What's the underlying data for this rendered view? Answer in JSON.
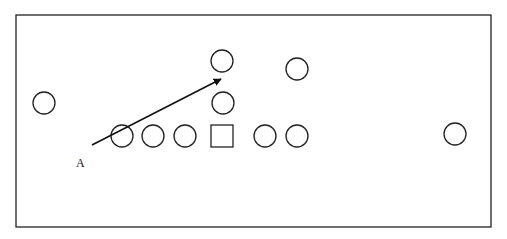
{
  "diagram": {
    "type": "formation-play-diagram",
    "frame": {
      "x": 16,
      "y": 15,
      "width": 475,
      "height": 212,
      "stroke": "#222222"
    },
    "players": [
      {
        "id": "circle-far-left",
        "shape": "circle",
        "cx": 44,
        "cy": 103,
        "r": 11
      },
      {
        "id": "circle-row-1",
        "shape": "circle",
        "cx": 122,
        "cy": 136,
        "r": 11
      },
      {
        "id": "circle-row-2",
        "shape": "circle",
        "cx": 153,
        "cy": 136,
        "r": 11
      },
      {
        "id": "circle-row-3",
        "shape": "circle",
        "cx": 185,
        "cy": 136,
        "r": 11
      },
      {
        "id": "square-center",
        "shape": "square",
        "x": 211,
        "y": 125,
        "size": 22
      },
      {
        "id": "circle-row-4",
        "shape": "circle",
        "cx": 265,
        "cy": 136,
        "r": 11
      },
      {
        "id": "circle-row-5",
        "shape": "circle",
        "cx": 297,
        "cy": 136,
        "r": 11
      },
      {
        "id": "circle-top",
        "shape": "circle",
        "cx": 222,
        "cy": 61,
        "r": 11
      },
      {
        "id": "circle-middle",
        "shape": "circle",
        "cx": 223,
        "cy": 103,
        "r": 11
      },
      {
        "id": "circle-top-right",
        "shape": "circle",
        "cx": 297,
        "cy": 69,
        "r": 11
      },
      {
        "id": "circle-far-right",
        "shape": "circle",
        "cx": 455,
        "cy": 134,
        "r": 11
      }
    ],
    "arrow": {
      "x1": 92,
      "y1": 145,
      "x2": 221,
      "y2": 79,
      "color": "#111111"
    },
    "labels": [
      {
        "text": "A",
        "x": 76,
        "y": 167
      }
    ]
  }
}
